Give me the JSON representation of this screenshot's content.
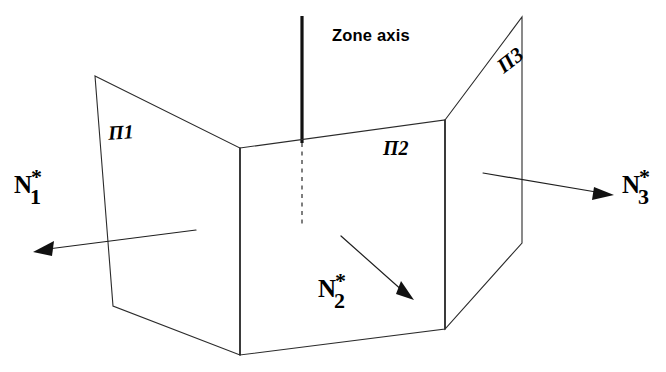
{
  "figure": {
    "background_color": "#ffffff",
    "line_color": "#2b2b2b",
    "zone_axis_color": "#111111",
    "width": 666,
    "height": 372
  },
  "zone_axis": {
    "label": "Zone axis",
    "solid_segment": {
      "x1": 302,
      "y1": 16,
      "x2": 302,
      "y2": 143
    },
    "dashed_segment": {
      "x1": 302,
      "y1": 143,
      "x2": 302,
      "y2": 228
    }
  },
  "planes": [
    {
      "id": "plane-1",
      "label": "Π1",
      "label_text": "Ш1",
      "display": "Π1",
      "vertices": "95,76 240,148 240,355 113,306",
      "label_pos": {
        "x": 108,
        "y": 122
      }
    },
    {
      "id": "plane-2",
      "label": "Π2",
      "display": "Π2",
      "vertices": "240,148 445,120 445,329 240,355",
      "label_pos": {
        "x": 383,
        "y": 138
      }
    },
    {
      "id": "plane-3",
      "label": "Π3",
      "display": "Π3",
      "vertices": "445,120 522,17 522,243 445,329",
      "label_pos": {
        "x": 497,
        "y": 50
      }
    }
  ],
  "normals": [
    {
      "id": "normal-1",
      "base": "N",
      "superscript": "*",
      "subscript": "1",
      "label_pos": {
        "x": 14,
        "y": 172
      },
      "shaft": {
        "x1": 196,
        "y1": 230,
        "x2": 48,
        "y2": 249
      },
      "arrow_tip": {
        "x": 33,
        "y": 252
      },
      "direction": "left-down"
    },
    {
      "id": "normal-2",
      "base": "N",
      "superscript": "*",
      "subscript": "2",
      "label_pos": {
        "x": 318,
        "y": 276
      },
      "shaft": {
        "x1": 341,
        "y1": 236,
        "x2": 404,
        "y2": 292
      },
      "arrow_tip": {
        "x": 414,
        "y": 300
      },
      "direction": "right-down"
    },
    {
      "id": "normal-3",
      "base": "N",
      "superscript": "*",
      "subscript": "3",
      "label_pos": {
        "x": 622,
        "y": 172
      },
      "shaft": {
        "x1": 483,
        "y1": 173,
        "x2": 602,
        "y2": 193
      },
      "arrow_tip": {
        "x": 614,
        "y": 195
      },
      "direction": "right-down"
    }
  ]
}
